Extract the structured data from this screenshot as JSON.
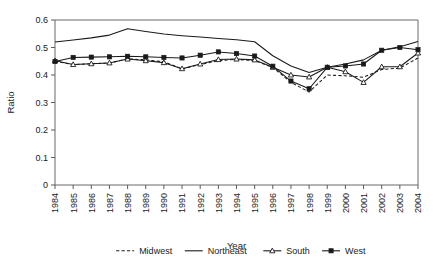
{
  "chart_data": {
    "type": "line",
    "title": "",
    "xlabel": "Year",
    "ylabel": "Ratio",
    "grid": false,
    "legend_position": "bottom",
    "x": [
      1984,
      1985,
      1986,
      1987,
      1988,
      1989,
      1990,
      1991,
      1992,
      1993,
      1994,
      1995,
      1996,
      1997,
      1998,
      1999,
      2000,
      2001,
      2002,
      2003,
      2004
    ],
    "categories": [
      "1984",
      "1985",
      "1986",
      "1987",
      "1988",
      "1989",
      "1990",
      "1991",
      "1992",
      "1993",
      "1994",
      "1995",
      "1996",
      "1997",
      "1998",
      "1999",
      "2000",
      "2001",
      "2002",
      "2003",
      "2004"
    ],
    "xlim": [
      1984,
      2004
    ],
    "ylim": [
      0,
      0.6
    ],
    "yticks": [
      "0",
      "0.1",
      "0.2",
      "0.3",
      "0.4",
      "0.5",
      "0.6"
    ],
    "ytick_values": [
      0,
      0.1,
      0.2,
      0.3,
      0.4,
      0.5,
      0.6
    ],
    "series": [
      {
        "name": "Midwest",
        "style": "dashed",
        "marker": "none",
        "color": "#1a1a1a",
        "values": [
          0.45,
          0.438,
          0.441,
          0.444,
          0.459,
          0.455,
          0.448,
          0.422,
          0.438,
          0.452,
          0.457,
          0.452,
          0.428,
          0.373,
          0.338,
          0.4,
          0.397,
          0.392,
          0.42,
          0.425,
          0.462
        ]
      },
      {
        "name": "Northeast",
        "style": "solid",
        "marker": "none",
        "color": "#1a1a1a",
        "values": [
          0.52,
          0.527,
          0.535,
          0.545,
          0.568,
          0.558,
          0.549,
          0.543,
          0.538,
          0.533,
          0.528,
          0.521,
          0.47,
          0.433,
          0.409,
          0.428,
          0.44,
          0.455,
          0.49,
          0.503,
          0.522
        ]
      },
      {
        "name": "South",
        "style": "solid",
        "marker": "open-triangle",
        "color": "#1a1a1a",
        "values": [
          0.452,
          0.438,
          0.441,
          0.444,
          0.458,
          0.452,
          0.445,
          0.423,
          0.44,
          0.456,
          0.458,
          0.455,
          0.428,
          0.4,
          0.393,
          0.428,
          0.412,
          0.373,
          0.43,
          0.43,
          0.48
        ]
      },
      {
        "name": "West",
        "style": "solid",
        "marker": "filled-square",
        "color": "#1a1a1a",
        "values": [
          0.449,
          0.464,
          0.465,
          0.466,
          0.468,
          0.466,
          0.464,
          0.462,
          0.472,
          0.484,
          0.478,
          0.469,
          0.432,
          0.378,
          0.35,
          0.428,
          0.433,
          0.44,
          0.49,
          0.5,
          0.492
        ]
      }
    ]
  },
  "legend": {
    "items": [
      {
        "label": "Midwest"
      },
      {
        "label": "Northeast"
      },
      {
        "label": "South"
      },
      {
        "label": "West"
      }
    ]
  },
  "axes": {
    "x_title": "Year",
    "y_title": "Ratio"
  }
}
